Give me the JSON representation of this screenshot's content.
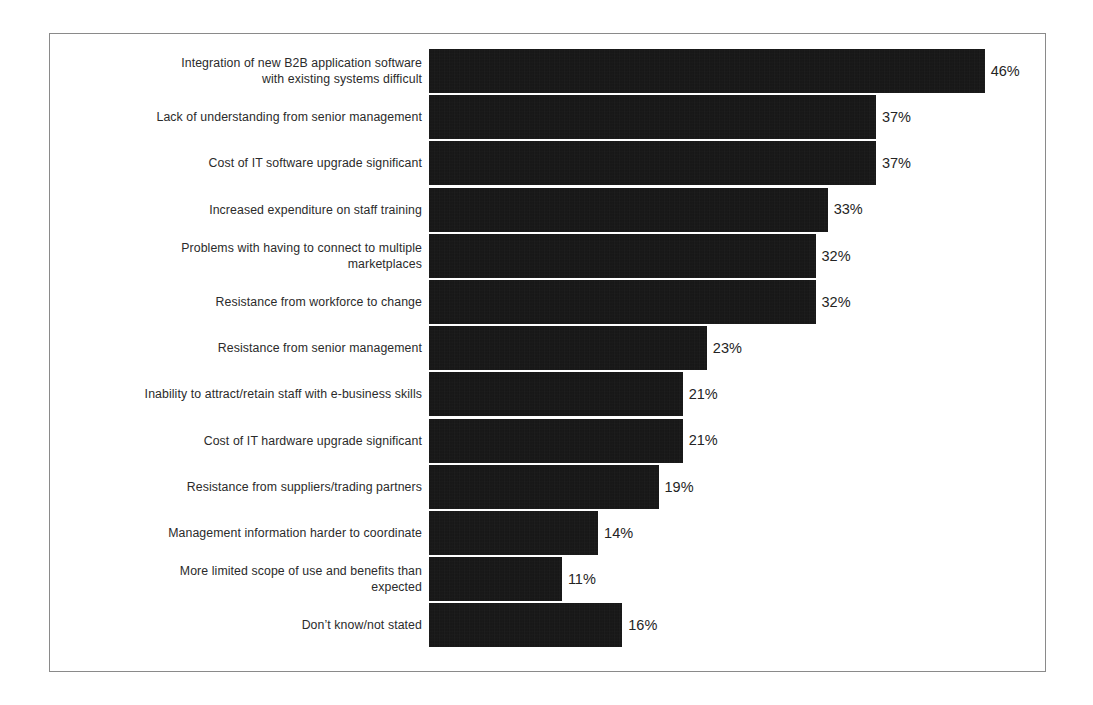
{
  "chart_data": {
    "type": "bar",
    "orientation": "horizontal",
    "title": "",
    "subtitle": "",
    "xlabel": "",
    "ylabel": "",
    "grid": false,
    "legend": null,
    "axis_visible": false,
    "value_suffix": "%",
    "xlim": [
      0,
      46
    ],
    "categories": [
      "Integration of new B2B application software\nwith existing systems difficult",
      "Lack of understanding from senior management",
      "Cost of IT software upgrade significant",
      "Increased expenditure on staff training",
      "Problems with having to connect to multiple marketplaces",
      "Resistance from workforce to change",
      "Resistance from senior management",
      "Inability to attract/retain staff with e-business skills",
      "Cost of IT hardware upgrade significant",
      "Resistance from suppliers/trading partners",
      "Management information harder to coordinate",
      "More limited scope of use and benefits than expected",
      "Don’t know/not stated"
    ],
    "values": [
      46,
      37,
      37,
      33,
      32,
      32,
      23,
      21,
      21,
      19,
      14,
      11,
      16
    ],
    "value_labels": [
      "46%",
      "37%",
      "37%",
      "33%",
      "32%",
      "32%",
      "23%",
      "21%",
      "21%",
      "19%",
      "14%",
      "11%",
      "16%"
    ],
    "bar_color": "#141414",
    "frame_color": "#8a8a8a",
    "background_color": "#ffffff",
    "label_color": "#2b2b2b"
  }
}
